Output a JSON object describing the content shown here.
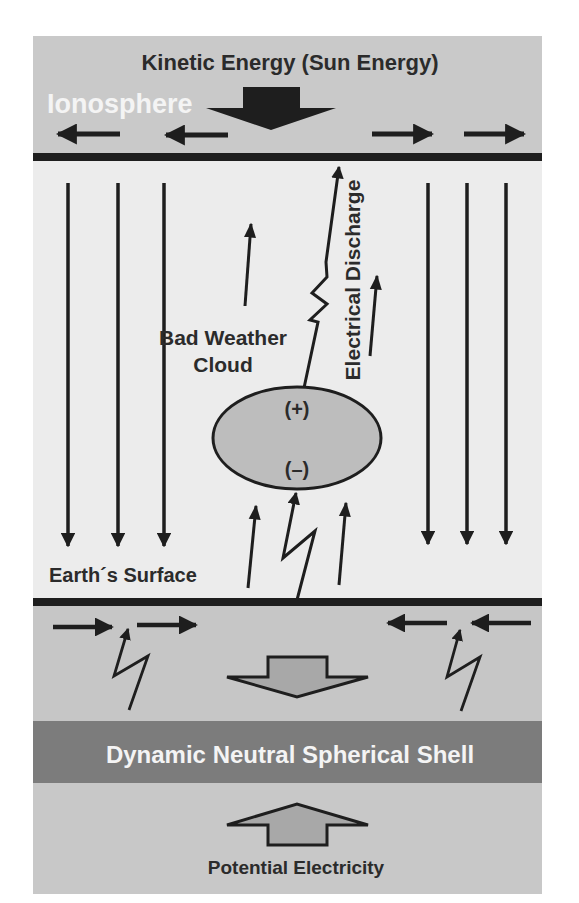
{
  "diagram": {
    "title_top": "Kinetic Energy (Sun Energy)",
    "ionosphere_label": "Ionosphere",
    "discharge_label": "Electrical Discharge",
    "cloud_label_line1": "Bad Weather",
    "cloud_label_line2": "Cloud",
    "cloud_positive": "(+)",
    "cloud_negative": "(–)",
    "earth_surface_label": "Earth´s Surface",
    "shell_label": "Dynamic Neutral Spherical Shell",
    "bottom_label": "Potential Electricity"
  },
  "colors": {
    "ionosphere_band": "#c9c9c9",
    "atmosphere_field": "#ececec",
    "ground_band": "#c6c6c6",
    "shell_band": "#7c7c7c",
    "cloud_fill": "#bdbdbd",
    "hollow_arrow_fill": "#a8a8a8",
    "line": "#1e1e1e"
  },
  "icons": {
    "sun_energy_arrow": "big-down-arrow",
    "field_lines": "down-arrows",
    "lightning": "zigzag-arrow",
    "shell_arrows": "hollow-up-down-arrows"
  }
}
